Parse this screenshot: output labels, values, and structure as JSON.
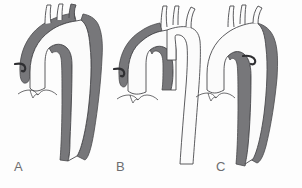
{
  "figure": {
    "background_color": "#fdfdfd",
    "outline_color": "#4a4a4d",
    "lumen_color": "#fbfbfb",
    "false_lumen_color": "#77777a",
    "label_color": "#6d6d70"
  },
  "panels": [
    {
      "id": "A",
      "label": "A",
      "ascending_aorta_shaded": true,
      "arch_shaded": true,
      "descending_aorta_shaded": true,
      "branch_vessel_count": 3,
      "coronary_origin_shown": true,
      "sinus_of_valsalva_shown": true
    },
    {
      "id": "B",
      "label": "B",
      "ascending_aorta_shaded": true,
      "arch_shaded": false,
      "descending_aorta_shaded": false,
      "branch_vessel_count": 3,
      "coronary_origin_shown": true,
      "sinus_of_valsalva_shown": true
    },
    {
      "id": "C",
      "label": "C",
      "ascending_aorta_shaded": false,
      "arch_shaded": false,
      "descending_aorta_shaded": true,
      "branch_vessel_count": 3,
      "coronary_origin_shown": true,
      "sinus_of_valsalva_shown": true
    }
  ]
}
